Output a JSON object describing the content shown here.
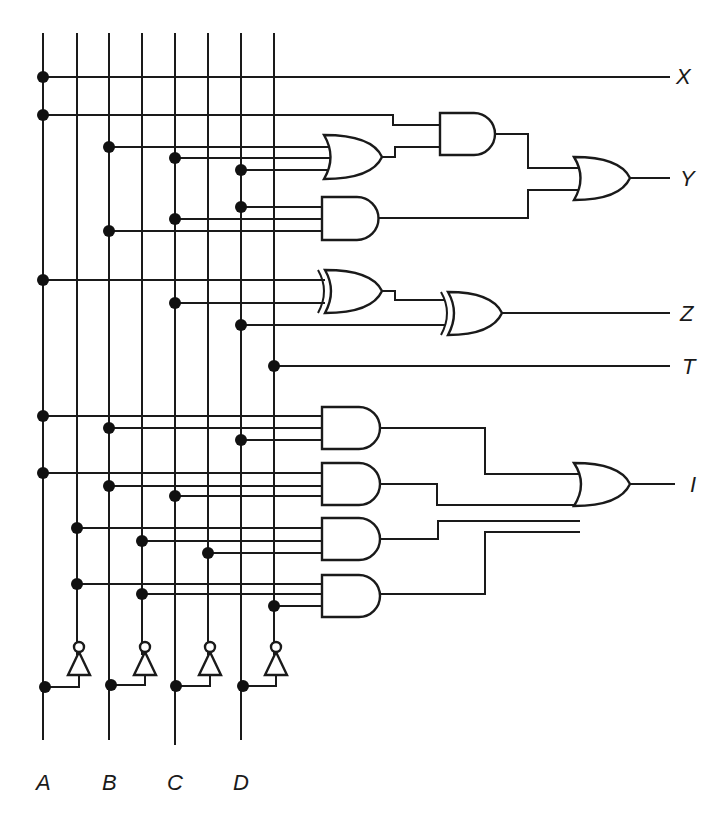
{
  "diagram": {
    "type": "combinational logic circuit",
    "inputs": [
      {
        "name": "A",
        "label": "A"
      },
      {
        "name": "B",
        "label": "B"
      },
      {
        "name": "C",
        "label": "C"
      },
      {
        "name": "D",
        "label": "D"
      }
    ],
    "outputs": [
      {
        "name": "X",
        "label": "X",
        "expression": "A"
      },
      {
        "name": "Y",
        "label": "Y",
        "expression": "A(B+C+D) + BCD"
      },
      {
        "name": "Z",
        "label": "Z",
        "expression": "A ⊕ C ⊕ D"
      },
      {
        "name": "T",
        "label": "T",
        "expression": "D'"
      },
      {
        "name": "I",
        "label": "I",
        "expression": "ABD + ABC + A'B'C' + A'B'D'"
      }
    ],
    "gates": [
      {
        "id": "or1",
        "type": "OR",
        "inputs": [
          "B",
          "C",
          "D"
        ]
      },
      {
        "id": "and1",
        "type": "AND",
        "inputs": [
          "A",
          "or1"
        ]
      },
      {
        "id": "and2",
        "type": "AND",
        "inputs": [
          "D",
          "C",
          "B"
        ]
      },
      {
        "id": "or3",
        "type": "OR",
        "inputs": [
          "and1",
          "and2"
        ],
        "output": "Y"
      },
      {
        "id": "xor1",
        "type": "XOR",
        "inputs": [
          "A",
          "C"
        ]
      },
      {
        "id": "xor2",
        "type": "XOR",
        "inputs": [
          "xor1",
          "D"
        ],
        "output": "Z"
      },
      {
        "id": "and3",
        "type": "AND",
        "inputs": [
          "A",
          "B",
          "D"
        ]
      },
      {
        "id": "and4",
        "type": "AND",
        "inputs": [
          "A",
          "B",
          "C"
        ]
      },
      {
        "id": "and5",
        "type": "AND",
        "inputs": [
          "A'",
          "B'",
          "C'"
        ]
      },
      {
        "id": "and6",
        "type": "AND",
        "inputs": [
          "A'",
          "B'",
          "D'"
        ]
      },
      {
        "id": "or4",
        "type": "OR",
        "inputs": [
          "and3",
          "and4",
          "and5",
          "and6"
        ],
        "output": "I"
      },
      {
        "id": "not_a",
        "type": "NOT",
        "inputs": [
          "A"
        ]
      },
      {
        "id": "not_b",
        "type": "NOT",
        "inputs": [
          "B"
        ]
      },
      {
        "id": "not_c",
        "type": "NOT",
        "inputs": [
          "C"
        ]
      },
      {
        "id": "not_d",
        "type": "NOT",
        "inputs": [
          "D"
        ]
      }
    ]
  }
}
